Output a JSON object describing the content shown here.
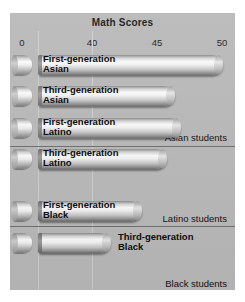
{
  "chart_data": {
    "type": "bar",
    "title": "Math Scores",
    "xlabel": "",
    "ylabel": "",
    "orientation": "horizontal",
    "xlim": [
      0,
      50
    ],
    "axis_break": true,
    "grid": true,
    "tick_labels": [
      "0",
      "40",
      "45",
      "50"
    ],
    "tick_values": [
      0,
      40,
      45,
      50
    ],
    "legend_position": "none",
    "groups": [
      {
        "group_label": "Asian students",
        "categories": [
          "First-generation Asian",
          "Third-generation Asian"
        ],
        "values": [
          50.0,
          46.2
        ]
      },
      {
        "group_label": "Latino students",
        "categories": [
          "First-generation Latino",
          "Third-generation Latino"
        ],
        "values": [
          46.6,
          45.4
        ]
      },
      {
        "group_label": "Black students",
        "categories": [
          "First-generation Black",
          "Third-generation Black"
        ],
        "values": [
          43.6,
          41.2
        ]
      }
    ],
    "bars": [
      {
        "label_line1": "First-generation",
        "label_line2": "Asian",
        "value": 50.0,
        "label_placement": "inside"
      },
      {
        "label_line1": "Third-generation",
        "label_line2": "Asian",
        "value": 46.2,
        "label_placement": "inside"
      },
      {
        "label_line1": "First-generation",
        "label_line2": "Latino",
        "value": 46.6,
        "label_placement": "inside"
      },
      {
        "label_line1": "Third-generation",
        "label_line2": "Latino",
        "value": 45.4,
        "label_placement": "inside"
      },
      {
        "label_line1": "First-generation",
        "label_line2": "Black",
        "value": 43.6,
        "label_placement": "inside"
      },
      {
        "label_line1": "Third-generation",
        "label_line2": "Black",
        "value": 41.2,
        "label_placement": "outside"
      }
    ]
  },
  "chart": {
    "title": "Math Scores",
    "ticks": [
      {
        "label": "0",
        "x": 12
      },
      {
        "label": "40",
        "x": 82
      },
      {
        "label": "45",
        "x": 147
      },
      {
        "label": "50",
        "x": 212
      }
    ],
    "gridlines_x": [
      28,
      82
    ],
    "groups": [
      {
        "label": "Asian students",
        "label_top": 82,
        "sep_top": 96
      },
      {
        "label": "Latino students",
        "label_top": 163,
        "sep_top": 176
      },
      {
        "label": "Black students",
        "label_top": 228,
        "sep_top": 243
      }
    ],
    "rows": [
      {
        "top": 2,
        "bar_right": 212,
        "label_left": 33,
        "label_placement": "inside"
      },
      {
        "top": 33,
        "bar_right": 164,
        "label_left": 33,
        "label_placement": "inside"
      },
      {
        "top": 65,
        "bar_right": 170,
        "label_left": 33,
        "label_placement": "inside"
      },
      {
        "top": 96,
        "bar_right": 156,
        "label_left": 33,
        "label_placement": "inside"
      },
      {
        "top": 148,
        "bar_right": 131,
        "label_left": 33,
        "label_placement": "inside"
      },
      {
        "top": 180,
        "bar_right": 100,
        "label_left": 108,
        "label_placement": "outside"
      }
    ]
  }
}
